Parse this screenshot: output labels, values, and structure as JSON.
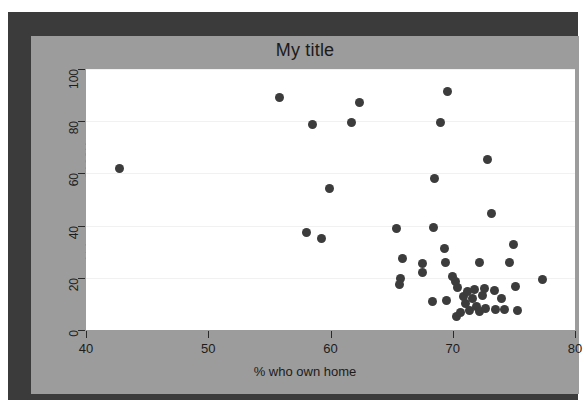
{
  "figure": {
    "background_color": "#ffffff",
    "frame_color": "#3b3b3b",
    "panel_color": "#9c9c9c",
    "plot_background": "#ffffff",
    "point_color": "#3c3c3c"
  },
  "chart_data": {
    "type": "scatter",
    "title": "My title",
    "xlabel": "% who own home",
    "ylabel": "% homes cost $100K+",
    "xlim": [
      40,
      80
    ],
    "ylim": [
      0,
      100
    ],
    "xticks": [
      40,
      50,
      60,
      70,
      80
    ],
    "yticks": [
      0,
      20,
      40,
      60,
      80,
      100
    ],
    "xtick_labels": [
      "40",
      "50",
      "60",
      "70",
      "80"
    ],
    "ytick_labels": [
      "0",
      "20",
      "40",
      "60",
      "80",
      "100"
    ],
    "grid": true,
    "grid_axis": "y",
    "legend": false,
    "marker": "filled-circle",
    "points": [
      [
        42.7,
        62.0
      ],
      [
        55.8,
        89.0
      ],
      [
        58.5,
        78.8
      ],
      [
        61.7,
        79.6
      ],
      [
        62.4,
        87.2
      ],
      [
        59.9,
        54.4
      ],
      [
        58.0,
        37.2
      ],
      [
        59.3,
        35.0
      ],
      [
        65.4,
        39.0
      ],
      [
        65.9,
        27.4
      ],
      [
        65.7,
        19.6
      ],
      [
        65.6,
        17.3
      ],
      [
        67.5,
        25.6
      ],
      [
        67.5,
        22.2
      ],
      [
        68.4,
        39.4
      ],
      [
        68.5,
        58.2
      ],
      [
        69.0,
        79.5
      ],
      [
        69.6,
        91.4
      ],
      [
        68.3,
        11.0
      ],
      [
        69.3,
        31.4
      ],
      [
        69.4,
        26.0
      ],
      [
        69.5,
        11.4
      ],
      [
        70.0,
        20.7
      ],
      [
        70.2,
        18.5
      ],
      [
        70.4,
        16.4
      ],
      [
        70.3,
        5.2
      ],
      [
        70.6,
        6.8
      ],
      [
        70.9,
        13.0
      ],
      [
        71.0,
        10.2
      ],
      [
        71.2,
        14.6
      ],
      [
        71.4,
        7.4
      ],
      [
        71.6,
        12.2
      ],
      [
        71.8,
        15.4
      ],
      [
        71.9,
        9.0
      ],
      [
        72.2,
        7.0
      ],
      [
        72.4,
        13.4
      ],
      [
        72.6,
        16.0
      ],
      [
        72.7,
        8.2
      ],
      [
        72.2,
        25.8
      ],
      [
        72.8,
        65.5
      ],
      [
        73.2,
        44.6
      ],
      [
        73.4,
        15.2
      ],
      [
        73.5,
        8.0
      ],
      [
        74.0,
        12.0
      ],
      [
        74.2,
        7.8
      ],
      [
        74.6,
        26.0
      ],
      [
        75.0,
        32.6
      ],
      [
        75.1,
        16.6
      ],
      [
        75.3,
        7.4
      ],
      [
        77.3,
        19.4
      ]
    ]
  }
}
